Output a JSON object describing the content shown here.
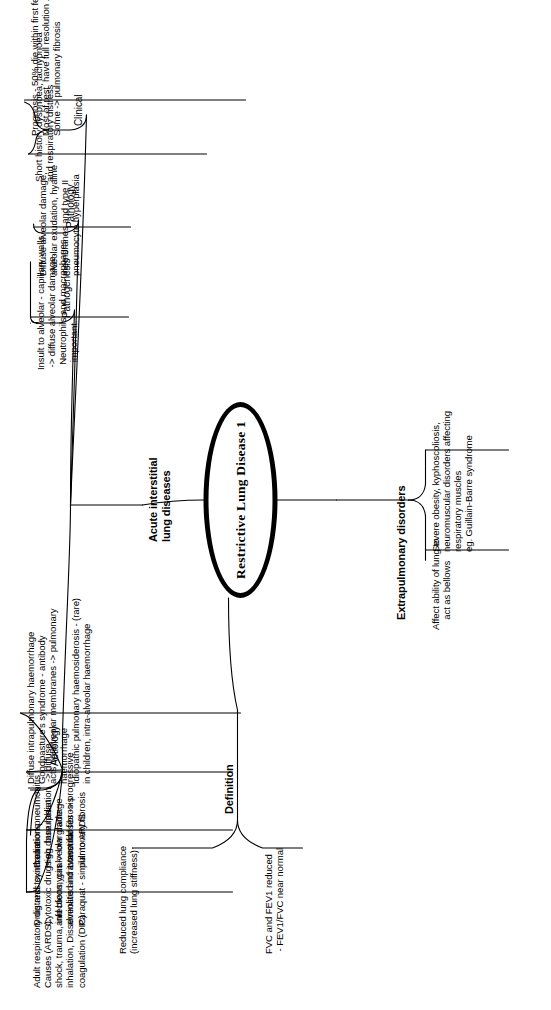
{
  "diagram": {
    "type": "mind-map",
    "title": "Restrictive Lung Disease 1",
    "orientation": "rotated-90-ccw",
    "root": {
      "label": "Restrictive Lung Disease 1"
    },
    "main_branches": [
      {
        "id": "definition",
        "label": "Definition"
      },
      {
        "id": "acute-interstitial",
        "label": "Acute interstitial\nlung diseases"
      },
      {
        "id": "extrapulmonary",
        "label": "Extrapulmonary disorders"
      }
    ],
    "definition": {
      "label": "Definition",
      "leaves": [
        {
          "id": "def-compliance",
          "text": "Reduced lung compliance\n(increased lung stiffness)"
        },
        {
          "id": "def-spirometry",
          "text": "FVC and FEV1 reduced\n - FEV1/FVC near normal"
        }
      ]
    },
    "extrapulmonary": {
      "label": "Extrapulmonary disorders",
      "leaves": [
        {
          "id": "extra-bellows",
          "text": "Affect ability of lung to\n    act as bellows"
        },
        {
          "id": "extra-causes",
          "text": "Severe obesity, kyphoscoliosis,\nneuromuscular disorders affecting\nrespiratory muscles\neg. Guillain-Barre syndrome"
        }
      ]
    },
    "acute_interstitial": {
      "label": "Acute interstitial\nlung diseases",
      "sub_branches": [
        {
          "id": "aetiology",
          "label": "Aetiology",
          "leaves": [
            {
              "id": "aet-ards",
              "text": "Adult respiratory distress syndrome\nCauses (ARDS):\nshock, trauma, infections, gas\ninhalation, Disseminated intravascular\ncoagulation (DIC)"
            },
            {
              "id": "aet-drugs",
              "text": "Drug and toxin reactions\nCytotoxic drugs eg. busulphan\nand bleomycin -> low grade\nalveolitis and interstitial fibrosis\nParaquat - similar to ARDS"
            },
            {
              "id": "aet-radiation",
              "text": "Radiation pneumonitis\nHigh dose radiation  -> diffuse\nalveolar damage\nLower doses -> progressive\npulmonary fibrosis"
            },
            {
              "id": "aet-haemorrhage",
              "text": "Diffuse intrapulmonary haemorrhage\nGoodpasture's syndrome - antibody\nacts on alveolar membranes -> pulmonary\nhaemorrhage\nIdiopathic pulmonary haemosiderosis - (rare)\nin children, intra-alveolar haemorrhage"
            }
          ]
        },
        {
          "id": "pathogenesis",
          "label": "Pathogenesis",
          "leaves": [
            {
              "id": "pg-insult",
              "text": "Insult to alveolar - capillary walls\n -> diffuse alveolar damage.\n  Neutrophils and macrophages\n   important."
            }
          ]
        },
        {
          "id": "pathology",
          "label": "Pathology",
          "leaves": [
            {
              "id": "path-dad",
              "text": "Diffuse alveolar damage,\nalveolar exudation, hyaline\nmembranes and type II\npneumocyte hyperplasia"
            }
          ]
        },
        {
          "id": "clinical",
          "label": "Clinical",
          "leaves": [
            {
              "id": "clin-history",
              "text": "Short history dyspnoea, tachypnoea\nand respiratory distress"
            },
            {
              "id": "clin-prognosis",
              "text": "Prognosis - 50% die within first few days.\nMost of rest  have full resolution .\nSome -> pulmonary fibrosis"
            }
          ]
        }
      ]
    },
    "colors": {
      "background": "#ffffff",
      "ink": "#000000"
    }
  }
}
